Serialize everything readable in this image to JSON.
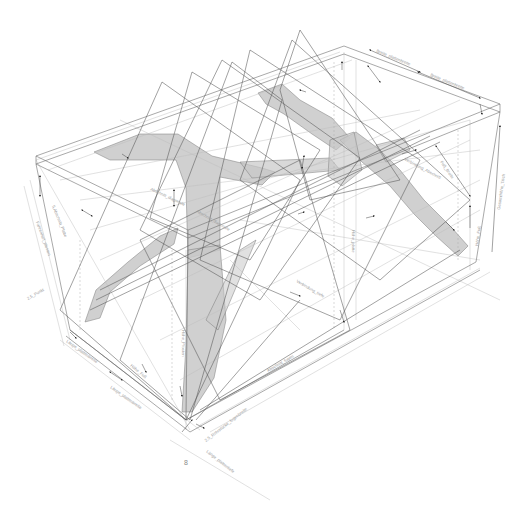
{
  "drawing": {
    "title": "Isometric table structure — construction drawing",
    "view": "isometric",
    "colors": {
      "background": "#ffffff",
      "frame_line": "#6e6e6e",
      "construction_line": "#b9b9b9",
      "shade_fill": "#c8c8c8",
      "shade_stroke": "#7a7a7a",
      "arrow": "#1a1a1a",
      "label_text": "#9a9a9a"
    },
    "sheet_number": "8",
    "dimension_labels": [
      {
        "id": "dim-left-1",
        "text": "2,5_Punkt",
        "x": 28,
        "y": 300,
        "rot": 60
      },
      {
        "id": "dim-left-2",
        "text": "Fahrenheit_pfosten",
        "x": 40,
        "y": 240,
        "rot": 70
      },
      {
        "id": "dim-left-3",
        "text": "5,Abschnitt_Platte",
        "x": 62,
        "y": 210,
        "rot": 68
      },
      {
        "id": "dim-front-1",
        "text": "Länge_plattenbreite",
        "x": 75,
        "y": 340,
        "rot": 35
      },
      {
        "id": "dim-front-2",
        "text": "Länge_plattenbreite",
        "x": 115,
        "y": 385,
        "rot": 35
      },
      {
        "id": "dim-front-3",
        "text": "Höhe_Fuß",
        "x": 135,
        "y": 370,
        "rot": 40
      },
      {
        "id": "dim-front-4",
        "text": "2,5_Rohrstücke_fugenbreite",
        "x": 210,
        "y": 440,
        "rot": -38
      },
      {
        "id": "dim-front-5",
        "text": "Länge_plattentiefe",
        "x": 210,
        "y": 455,
        "rot": 38
      },
      {
        "id": "dim-mid-1",
        "text": "Abschnitt_fugen",
        "x": 270,
        "y": 380,
        "rot": -30
      },
      {
        "id": "dim-mid-2",
        "text": "Verbindung_tiefe",
        "x": 300,
        "y": 290,
        "rot": 30
      },
      {
        "id": "dim-mid-3",
        "text": "Höhe_platte",
        "x": 350,
        "y": 230,
        "rot": 90
      },
      {
        "id": "dim-mid-4",
        "text": "Höhe_Pfosten",
        "x": 185,
        "y": 350,
        "rot": 90
      },
      {
        "id": "dim-top-1",
        "text": "Breite_plattenbreite",
        "x": 380,
        "y": 55,
        "rot": 25
      },
      {
        "id": "dim-top-2",
        "text": "Breite_plattenbreite",
        "x": 440,
        "y": 80,
        "rot": 25
      },
      {
        "id": "dim-right-1",
        "text": "Verbindung_Abschnitt",
        "x": 410,
        "y": 165,
        "rot": 30
      },
      {
        "id": "dim-right-2",
        "text": "Fuß_Breite",
        "x": 435,
        "y": 175,
        "rot": 45
      },
      {
        "id": "dim-right-3",
        "text": "Gesamthöhe_Tisch",
        "x": 498,
        "y": 200,
        "rot": -80
      },
      {
        "id": "dim-right-4",
        "text": "Höhe_Fuß",
        "x": 478,
        "y": 235,
        "rot": -80
      },
      {
        "id": "dim-inner-1",
        "text": "Abschnitt_diagonale",
        "x": 200,
        "y": 210,
        "rot": 30
      },
      {
        "id": "dim-inner-2",
        "text": "Abschnitt_diagonale",
        "x": 160,
        "y": 190,
        "rot": 25
      }
    ]
  }
}
